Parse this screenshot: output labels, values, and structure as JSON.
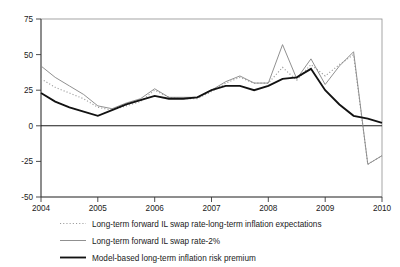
{
  "chart_data": {
    "type": "line",
    "title": "",
    "xlabel": "",
    "ylabel": "",
    "xlim": [
      2004,
      2010
    ],
    "ylim": [
      -50,
      75
    ],
    "yticks": [
      75,
      50,
      25,
      0,
      -25,
      -50
    ],
    "ytick_labels": [
      "75",
      "50",
      "25",
      "0",
      "-25",
      "-50"
    ],
    "xticks": [
      2004,
      2005,
      2006,
      2007,
      2008,
      2009,
      2010
    ],
    "xtick_labels": [
      "2004",
      "2005",
      "2006",
      "2007",
      "2008",
      "2009",
      "2010"
    ],
    "grid": false,
    "legend_position": "below",
    "zero_line": 0,
    "series": [
      {
        "name": "Long-term forward IL swap rate-long-term inflation expectations",
        "style": "dotted",
        "color": "#9a9a9a",
        "x": [
          2004.0,
          2004.25,
          2004.5,
          2004.75,
          2005.0,
          2005.25,
          2005.5,
          2005.75,
          2006.0,
          2006.25,
          2006.5,
          2006.75,
          2007.0,
          2007.25,
          2007.5,
          2007.75,
          2008.0,
          2008.25,
          2008.5,
          2008.75,
          2009.0,
          2009.25,
          2009.5,
          2009.75,
          2010.0
        ],
        "values": [
          33,
          27,
          23,
          19,
          13,
          11,
          14,
          17,
          25,
          20,
          19,
          19,
          24,
          30,
          34,
          30,
          30,
          41,
          32,
          43,
          35,
          43,
          50,
          -27,
          -21
        ]
      },
      {
        "name": "Long-term forward IL swap rate-2%",
        "style": "thin-solid",
        "color": "#8a8a8a",
        "x": [
          2004.0,
          2004.25,
          2004.5,
          2004.75,
          2005.0,
          2005.25,
          2005.5,
          2005.75,
          2006.0,
          2006.25,
          2006.5,
          2006.75,
          2007.0,
          2007.25,
          2007.5,
          2007.75,
          2008.0,
          2008.25,
          2008.5,
          2008.75,
          2009.0,
          2009.25,
          2009.5,
          2009.75,
          2010.0
        ],
        "values": [
          42,
          34,
          28,
          22,
          14,
          12,
          16,
          19,
          26,
          20,
          20,
          20,
          25,
          31,
          35,
          30,
          30,
          57,
          33,
          47,
          29,
          42,
          52,
          -27,
          -21
        ]
      },
      {
        "name": "Model-based long-term inflation risk premium",
        "style": "thick-solid",
        "color": "#121212",
        "x": [
          2004.0,
          2004.25,
          2004.5,
          2004.75,
          2005.0,
          2005.25,
          2005.5,
          2005.75,
          2006.0,
          2006.25,
          2006.5,
          2006.75,
          2007.0,
          2007.25,
          2007.5,
          2007.75,
          2008.0,
          2008.25,
          2008.5,
          2008.75,
          2009.0,
          2009.25,
          2009.5,
          2009.75,
          2010.0
        ],
        "values": [
          23,
          17,
          13,
          10,
          7,
          11,
          15,
          18,
          21,
          19,
          19,
          20,
          25,
          28,
          28,
          25,
          28,
          33,
          34,
          40,
          25,
          15,
          7,
          5,
          2
        ]
      }
    ]
  },
  "legend": {
    "entries": [
      {
        "label": "Long-term forward IL swap rate-long-term inflation expectations",
        "marker": "dotted-line-marker"
      },
      {
        "label": "Long-term forward IL swap rate-2%",
        "marker": "thin-line-marker"
      },
      {
        "label": "Model-based long-term inflation risk premium",
        "marker": "thick-line-marker"
      }
    ]
  },
  "colors": {
    "dotted_series": "#9a9a9a",
    "thin_series": "#8a8a8a",
    "thick_series": "#121212",
    "frame": "#8e8e8e",
    "axis": "#3a3a3a"
  }
}
